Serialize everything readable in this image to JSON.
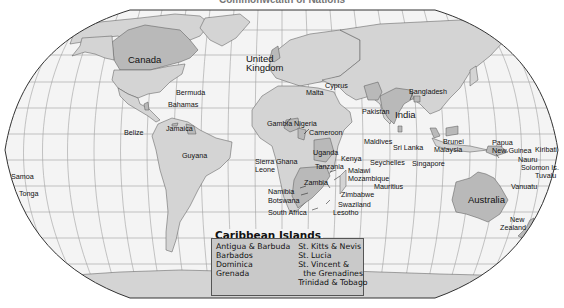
{
  "title": "Commonwealth of Nations",
  "colors": {
    "ocean": "#f4f4f4",
    "land": "#d4d4d4",
    "commonwealth": "#b9b9b9",
    "border": "#555555",
    "graticule": "#9a9a9a"
  },
  "labels": {
    "canada": "Canada",
    "united_kingdom_1": "United",
    "united_kingdom_2": "Kingdom",
    "bermuda": "Bermuda",
    "bahamas": "Bahamas",
    "belize": "Belize",
    "jamaica": "Jamaica",
    "guyana": "Guyana",
    "samoa": "Samoa",
    "tonga": "Tonga",
    "malta": "Malta",
    "cyprus": "Cyprus",
    "gambia": "Gambia",
    "nigeria": "Nigeria",
    "cameroon": "Cameroon",
    "sierra_leone_1": "Sierra",
    "sierra_leone_2": "Leone",
    "ghana": "Ghana",
    "uganda": "Uganda",
    "kenya": "Kenya",
    "tanzania": "Tanzania",
    "malawi": "Malawi",
    "mozambique": "Mozambique",
    "zambia": "Zambia",
    "namibia": "Namibia",
    "botswana": "Botswana",
    "zimbabwe": "Zimbabwe",
    "swaziland": "Swaziland",
    "lesotho": "Lesotho",
    "south_africa": "South Africa",
    "pakistan": "Pakistan",
    "india": "India",
    "bangladesh": "Bangladesh",
    "maldives": "Maldives",
    "sri_lanka": "Sri Lanka",
    "seychelles": "Seychelles",
    "mauritius": "Mauritius",
    "singapore": "Singapore",
    "brunei": "Brunei",
    "malaysia": "Malaysia",
    "papua_1": "Papua",
    "papua_2": "New Guinea",
    "kiribati": "Kiribati",
    "nauru": "Nauru",
    "solomon": "Solomon Is.",
    "tuvalu": "Tuvalu",
    "vanuatu": "Vanuatu",
    "australia": "Australia",
    "new_zealand_1": "New",
    "new_zealand_2": "Zealand"
  },
  "caribbean": {
    "title": "Caribbean Islands",
    "col1": [
      "Antigua & Barbuda",
      "Barbados",
      "Dominica",
      "Grenada"
    ],
    "col2": [
      "St. Kitts & Nevis",
      "St. Lucia",
      "St. Vincent &",
      "the Grenadines",
      "Trinidad & Tobago"
    ]
  }
}
